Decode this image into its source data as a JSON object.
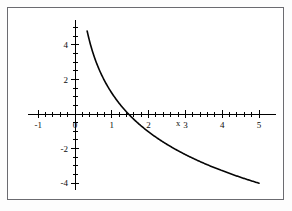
{
  "figure": {
    "background_color": "#fdfdfd",
    "plot_background_color": "#ffffff",
    "border_color": "#6b6b70"
  },
  "chart_data": {
    "type": "line",
    "title": "",
    "xlabel": "x",
    "ylabel": "",
    "xlim": [
      -1.45,
      5.55
    ],
    "ylim": [
      -5.1,
      5.6
    ],
    "grid": false,
    "legend": null,
    "curve_color": "#050505",
    "axis_color": "#000000",
    "x_major_ticks": [
      -1,
      0,
      1,
      2,
      3,
      4,
      5
    ],
    "x_major_tick_labels": [
      "-1",
      "0",
      "1",
      "2",
      "3",
      "4",
      "5"
    ],
    "x_minor_tick_step": 0.2,
    "y_major_ticks": [
      -4,
      -2,
      0,
      2,
      4
    ],
    "y_major_tick_labels": [
      "-4",
      "-2",
      "0",
      "2",
      "4"
    ],
    "y_minor_tick_step": 0.5,
    "series": [
      {
        "name": "curve",
        "x": [
          0.33,
          0.36,
          0.4,
          0.45,
          0.5,
          0.55,
          0.6,
          0.65,
          0.7,
          0.8,
          0.9,
          1.0,
          1.1,
          1.2,
          1.35,
          1.5,
          1.7,
          2.0,
          2.3,
          2.6,
          3.0,
          3.4,
          3.8,
          4.2,
          4.6,
          5.0
        ],
        "y": [
          4.8,
          4.55,
          4.2,
          3.85,
          3.55,
          3.25,
          3.0,
          2.78,
          2.58,
          2.22,
          1.92,
          1.65,
          1.42,
          1.2,
          0.95,
          0.72,
          0.45,
          0.02,
          -0.38,
          -0.72,
          -1.12,
          -1.48,
          -1.8,
          -2.1,
          -2.38,
          -2.62
        ],
        "x_intercept": 1.35,
        "start_point": [
          0.33,
          4.8
        ],
        "end_point": [
          5.0,
          -4.0
        ],
        "shape": "monotone decreasing, concave up, logarithmic"
      }
    ],
    "data_points": {
      "at_x_1": 1.65,
      "at_x_2": -0.75,
      "at_x_3": -1.4,
      "at_x_4": -2.1,
      "at_x_5": -4.0
    }
  }
}
